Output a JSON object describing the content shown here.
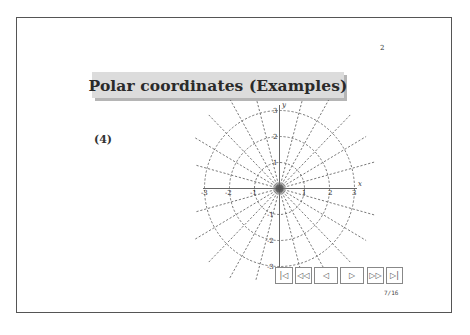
{
  "slide": {
    "page_number": "2",
    "title": "Polar coordinates (Examples)",
    "example_label": "(4)",
    "slide_counter": "7/16"
  },
  "plot": {
    "description": "Polar coordinate grid with concentric dashed circles and radial dashed lines",
    "x_axis_label": "x",
    "y_axis_label": "y",
    "x_tick_labels": [
      "-3",
      "-2",
      "-1",
      "1",
      "2",
      "3"
    ],
    "y_tick_labels": [
      "3",
      "2",
      "1",
      "-1",
      "-2",
      "-3"
    ],
    "circle_radii": [
      1,
      2,
      3
    ],
    "radial_line_step_degrees": 15
  },
  "navigation": {
    "buttons": [
      {
        "name": "first-slide",
        "glyph": "|◁"
      },
      {
        "name": "previous-section",
        "glyph": "◁◁"
      },
      {
        "name": "previous-slide",
        "glyph": "◁"
      },
      {
        "name": "next-slide",
        "glyph": "▷"
      },
      {
        "name": "next-section",
        "glyph": "▷▷"
      },
      {
        "name": "last-slide",
        "glyph": "▷|"
      }
    ]
  },
  "colors": {
    "frame_border": "#555555",
    "title_bg": "#dcdcdc",
    "title_shadow": "#b5b5b5",
    "grid": "#555555"
  }
}
